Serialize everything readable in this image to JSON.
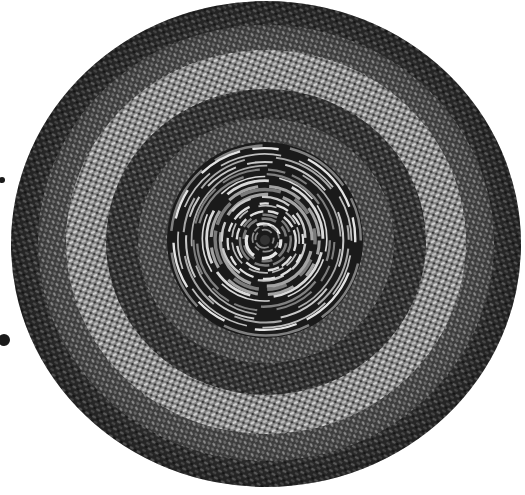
{
  "image": {
    "subject": "Round braided rug",
    "description": "Grayscale photograph of a circular braided rug with concentric light and dark bands and a tightly coiled spiral center",
    "width": 525,
    "height": 495
  },
  "rug": {
    "center": [
      266,
      242
    ],
    "radius_x": 252,
    "radius_y": 243,
    "bands": [
      {
        "r_from": 1.0,
        "r_to": 0.9,
        "tone": "#3a3a3a"
      },
      {
        "r_from": 0.9,
        "r_to": 0.8,
        "tone": "#4a4a4a"
      },
      {
        "r_from": 0.8,
        "r_to": 0.7,
        "tone": "#8a8a8a"
      },
      {
        "r_from": 0.7,
        "r_to": 0.62,
        "tone": "#a0a0a0"
      },
      {
        "r_from": 0.62,
        "r_to": 0.52,
        "tone": "#555555"
      },
      {
        "r_from": 0.52,
        "r_to": 0.42,
        "tone": "#4a4a4a"
      }
    ],
    "core": {
      "center": [
        265,
        240
      ],
      "radius": 98,
      "ring_count": 22,
      "dark": "#1a1a1a",
      "light": "#d8d8d8"
    }
  },
  "artifacts": [
    {
      "type": "dark-blob",
      "x": 4,
      "y": 340,
      "r": 6
    },
    {
      "type": "dark-blob",
      "x": 2,
      "y": 180,
      "r": 3
    }
  ],
  "colors": {
    "background": "#ffffff",
    "braid_dark": "#2a2a2a",
    "braid_light": "#b5b5b5"
  }
}
